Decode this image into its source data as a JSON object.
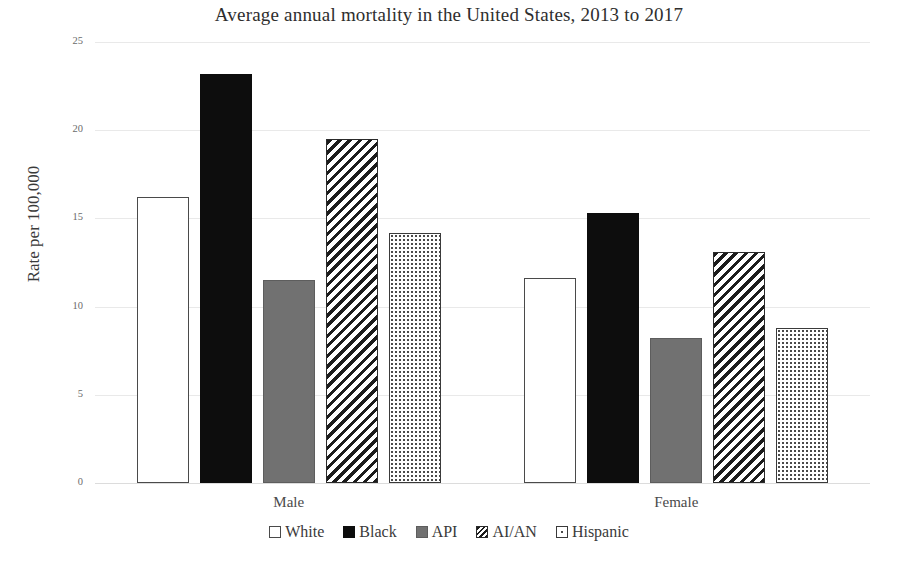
{
  "chart_data": {
    "type": "bar",
    "title": "Average annual mortality in the United States, 2013 to 2017",
    "xlabel": "",
    "ylabel": "Rate per 100,000",
    "categories": [
      "Male",
      "Female"
    ],
    "series": [
      {
        "name": "White",
        "pattern": "hollow",
        "values": [
          16.2,
          11.6
        ]
      },
      {
        "name": "Black",
        "pattern": "solid",
        "values": [
          23.2,
          15.3
        ]
      },
      {
        "name": "API",
        "pattern": "gray",
        "values": [
          11.5,
          8.2
        ]
      },
      {
        "name": "AI/AN",
        "pattern": "diagonal",
        "values": [
          19.5,
          13.1
        ]
      },
      {
        "name": "Hispanic",
        "pattern": "dotted",
        "values": [
          14.2,
          8.8
        ]
      }
    ],
    "ylim": [
      0,
      25
    ],
    "yticks": [
      0,
      5,
      10,
      15,
      20,
      25
    ],
    "ytick_labels": [
      "0",
      "5",
      "10",
      "15",
      "20",
      "25"
    ],
    "grid": true,
    "legend_position": "bottom"
  },
  "colors": {
    "white_fill": "#ffffff",
    "black_fill": "#0d0d0d",
    "gray_fill": "#717171",
    "hatch_stroke": "#1c1c1c",
    "dot_color": "#4a4a4a",
    "gridline": "#e9e9e9",
    "text": "#3a3a3a"
  }
}
